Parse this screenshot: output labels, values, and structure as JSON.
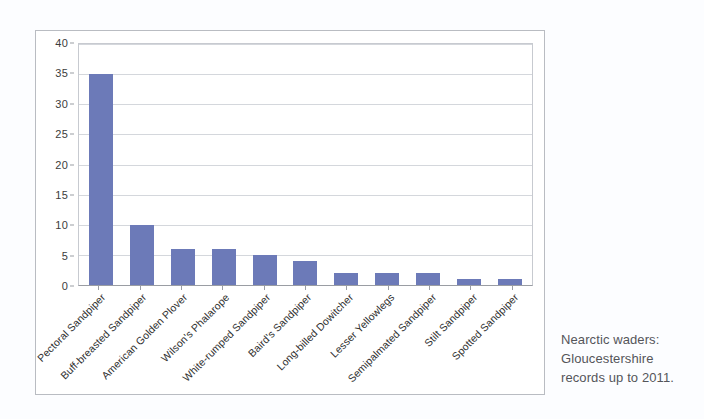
{
  "chart_data": {
    "type": "bar",
    "title": "",
    "xlabel": "",
    "ylabel": "",
    "ylim": [
      0,
      40
    ],
    "y_ticks": [
      0,
      5,
      10,
      15,
      20,
      25,
      30,
      35,
      40
    ],
    "grid": "horizontal",
    "legend": "none",
    "bar_color": "#6c7ab8",
    "categories": [
      "Pectoral Sandpiper",
      "Buff-breasted Sandpiper",
      "American Golden Plover",
      "Wilson's Phalarope",
      "White-rumped Sandpiper",
      "Baird's Sandpiper",
      "Long-billed Dowitcher",
      "Lesser Yellowlegs",
      "Semipalmated Sandpiper",
      "Stilt Sandpiper",
      "Spotted Sandpiper"
    ],
    "values": [
      35,
      10,
      6,
      6,
      5,
      4,
      2,
      2,
      2,
      1,
      1
    ]
  },
  "caption": {
    "line1": "Nearctic waders:",
    "line2": "Gloucestershire",
    "line3": "records up to 2011."
  }
}
